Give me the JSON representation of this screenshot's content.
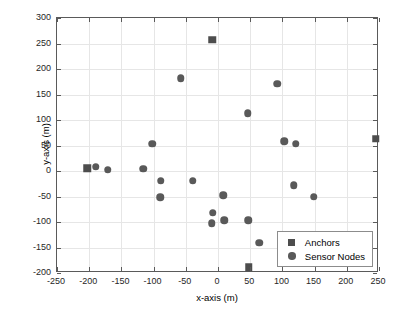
{
  "chart_data": {
    "type": "scatter",
    "title": "",
    "xlabel": "x-axis (m)",
    "ylabel": "y-axis (m)",
    "xlim": [
      -250,
      250
    ],
    "ylim": [
      -200,
      300
    ],
    "xticks": [
      -250,
      -200,
      -150,
      -100,
      -50,
      0,
      50,
      100,
      150,
      200,
      250
    ],
    "yticks": [
      -200,
      -150,
      -100,
      -50,
      0,
      50,
      100,
      150,
      200,
      250,
      300
    ],
    "xtick_labels": [
      "-250",
      "-200",
      "-150",
      "-100",
      "-50",
      "0",
      "50",
      "100",
      "150",
      "200",
      "250"
    ],
    "ytick_labels": [
      "-200",
      "-150",
      "-100",
      "-50",
      "0",
      "50",
      "100",
      "150",
      "200",
      "250",
      "300"
    ],
    "grid": true,
    "legend_position": "lower right",
    "series": [
      {
        "name": "Anchors",
        "marker": "square",
        "color": "#4d4d4d",
        "points": [
          {
            "x": -203,
            "y": 5
          },
          {
            "x": -9,
            "y": 257
          },
          {
            "x": 48,
            "y": -189
          },
          {
            "x": 245,
            "y": 63
          }
        ]
      },
      {
        "name": "Sensor Nodes",
        "marker": "circle",
        "color": "#595959",
        "points": [
          {
            "x": -190,
            "y": 8
          },
          {
            "x": -171,
            "y": 2
          },
          {
            "x": -116,
            "y": 4
          },
          {
            "x": -102,
            "y": 53
          },
          {
            "x": -89,
            "y": -19
          },
          {
            "x": -90,
            "y": -51
          },
          {
            "x": -58,
            "y": 182
          },
          {
            "x": -39,
            "y": -19
          },
          {
            "x": -8,
            "y": -82
          },
          {
            "x": -10,
            "y": -102
          },
          {
            "x": 8,
            "y": -48
          },
          {
            "x": 10,
            "y": -97
          },
          {
            "x": 46,
            "y": 113
          },
          {
            "x": 47,
            "y": -97
          },
          {
            "x": 64,
            "y": -141
          },
          {
            "x": 92,
            "y": 171
          },
          {
            "x": 103,
            "y": 58
          },
          {
            "x": 118,
            "y": -28
          },
          {
            "x": 121,
            "y": 53
          },
          {
            "x": 149,
            "y": -50
          }
        ]
      }
    ]
  },
  "legend": {
    "items": [
      {
        "label": "Anchors",
        "marker": "square"
      },
      {
        "label": "Sensor Nodes",
        "marker": "circle"
      }
    ]
  }
}
